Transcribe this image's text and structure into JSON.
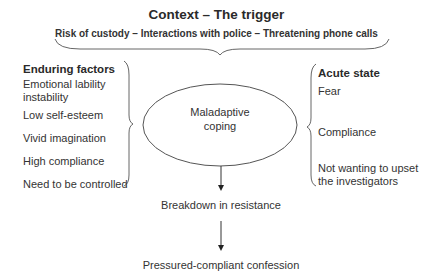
{
  "diagram": {
    "title": "Context – The trigger",
    "subtitle": "Risk of custody – Interactions with police – Threatening phone calls",
    "enduring_factors": {
      "heading": "Enduring factors",
      "items": [
        "Emotional lability",
        "instability",
        "Low self-esteem",
        "Vivid imagination",
        "High compliance",
        "Need to be controlled"
      ]
    },
    "center_node": {
      "line1": "Maladaptive",
      "line2": "coping"
    },
    "acute_state": {
      "heading": "Acute state",
      "items": [
        "Fear",
        "Compliance",
        "Not wanting to upset",
        "the investigators"
      ]
    },
    "flow": {
      "step1": "Breakdown in resistance",
      "step2": "Pressured-compliant confession"
    },
    "colors": {
      "line": "#555555",
      "text": "#2a2a2a"
    }
  }
}
